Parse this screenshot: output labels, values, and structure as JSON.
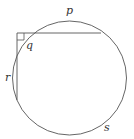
{
  "diagram": {
    "labels": {
      "p": "p",
      "q": "q",
      "r": "r",
      "s": "s"
    },
    "stroke_color": "#555555"
  }
}
